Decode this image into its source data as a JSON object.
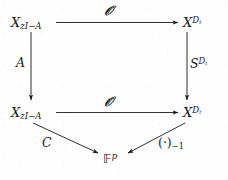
{
  "diagram": {
    "type": "commutative-diagram",
    "background_color": "#fefefe",
    "ink_color": "#1a1a1a",
    "nodes": [
      {
        "id": "top-left",
        "position": "top-left",
        "base": "X",
        "sub": "zI−A",
        "sup": ""
      },
      {
        "id": "top-right",
        "position": "top-right",
        "base": "X",
        "sub": "",
        "sup": "D",
        "sup_sub": "t"
      },
      {
        "id": "bottom-left",
        "position": "bottom-left",
        "base": "X",
        "sub": "zI−A",
        "sup": ""
      },
      {
        "id": "bottom-right",
        "position": "bottom-right",
        "base": "X",
        "sub": "",
        "sup": "D",
        "sup_sub": "t"
      },
      {
        "id": "target",
        "position": "bottom-center",
        "base": "𝔽",
        "sub": "",
        "sup": "p"
      }
    ],
    "node_labels": {
      "top_left_base": "X",
      "top_left_sub": "zI−A",
      "top_right_base": "X",
      "top_right_sup": "D",
      "top_right_sup_sub": "t",
      "bottom_left_base": "X",
      "bottom_left_sub": "zI−A",
      "bottom_right_base": "X",
      "bottom_right_sup": "D",
      "bottom_right_sup_sub": "t",
      "target_base": "𝔽",
      "target_sup": "p"
    },
    "edges": [
      {
        "id": "top-arrow",
        "from": "top-left",
        "to": "top-right",
        "label": "ᵊa",
        "direction": "right"
      },
      {
        "id": "bottom-arrow",
        "from": "bottom-left",
        "to": "bottom-right",
        "label": "ᵊa",
        "direction": "right"
      },
      {
        "id": "left-arrow",
        "from": "top-left",
        "to": "bottom-left",
        "label": "A",
        "direction": "down"
      },
      {
        "id": "right-arrow",
        "from": "top-right",
        "to": "bottom-right",
        "label": "S",
        "direction": "down"
      },
      {
        "id": "diag-left",
        "from": "bottom-left",
        "to": "target",
        "label": "C",
        "direction": "down-right"
      },
      {
        "id": "diag-right",
        "from": "bottom-right",
        "to": "target",
        "label": "(·)",
        "direction": "down-left"
      }
    ],
    "edge_labels": {
      "top": "𝒪",
      "bottom": "𝒪",
      "left": "A",
      "right_base": "S",
      "right_sup": "D",
      "right_sup_sub": "t",
      "diag_left": "C",
      "diag_right_base": "(·)",
      "diag_right_sub": "−1"
    }
  }
}
